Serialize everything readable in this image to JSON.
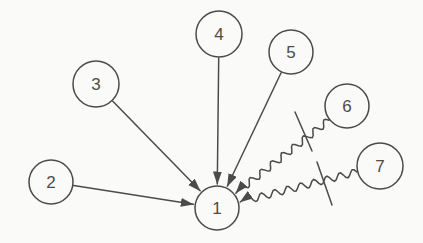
{
  "diagram": {
    "background_color": "#fafaf8",
    "stroke_color": "#4b4b4b",
    "text_color": "#4b4b4b",
    "nodes": [
      {
        "id": "1",
        "label": "1",
        "x": 217,
        "y": 208,
        "r": 22
      },
      {
        "id": "2",
        "label": "2",
        "x": 51,
        "y": 182,
        "r": 22
      },
      {
        "id": "3",
        "label": "3",
        "x": 96,
        "y": 84,
        "r": 23
      },
      {
        "id": "4",
        "label": "4",
        "x": 219,
        "y": 34,
        "r": 23
      },
      {
        "id": "5",
        "label": "5",
        "x": 291,
        "y": 52,
        "r": 22
      },
      {
        "id": "6",
        "label": "6",
        "x": 347,
        "y": 106,
        "r": 22
      },
      {
        "id": "7",
        "label": "7",
        "x": 380,
        "y": 166,
        "r": 23
      }
    ],
    "edges": [
      {
        "from": "2",
        "to": "1",
        "style": "straight"
      },
      {
        "from": "3",
        "to": "1",
        "style": "straight"
      },
      {
        "from": "4",
        "to": "1",
        "style": "straight"
      },
      {
        "from": "5",
        "to": "1",
        "style": "straight"
      },
      {
        "from": "6",
        "to": "1",
        "style": "wavy"
      },
      {
        "from": "7",
        "to": "1",
        "style": "wavy"
      }
    ],
    "barrier_segments": [
      {
        "x1": 295,
        "y1": 112,
        "x2": 312,
        "y2": 151
      },
      {
        "x1": 317,
        "y1": 162,
        "x2": 332,
        "y2": 205
      }
    ],
    "wave": {
      "amplitude": 3.5,
      "wavelength": 13.5,
      "tail": 9
    }
  }
}
